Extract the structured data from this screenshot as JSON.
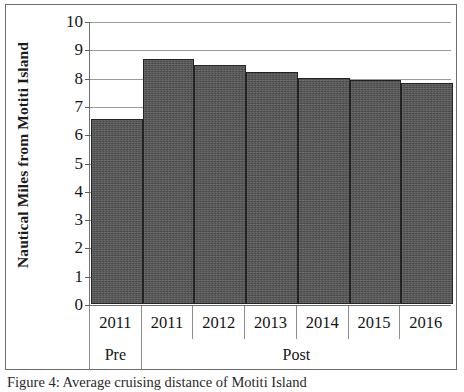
{
  "figure": {
    "caption": "Figure 4: Average cruising distance of Motiti Island"
  },
  "chart_data": {
    "type": "bar",
    "title": "",
    "xlabel": "",
    "ylabel": "Nautical Miles from Motiti Island",
    "categories": [
      "2011",
      "2011",
      "2012",
      "2013",
      "2014",
      "2015",
      "2016"
    ],
    "values": [
      6.55,
      8.65,
      8.45,
      8.2,
      8.0,
      7.9,
      7.8
    ],
    "groups": [
      {
        "label": "Pre",
        "span": 1
      },
      {
        "label": "Post",
        "span": 6
      }
    ],
    "ylim": [
      0,
      10
    ],
    "ytick_labels": [
      "10",
      "9",
      "8",
      "7",
      "6",
      "5",
      "4",
      "3",
      "2",
      "1",
      "0"
    ],
    "ytick_values": [
      10,
      9,
      8,
      7,
      6,
      5,
      4,
      3,
      2,
      1,
      0
    ],
    "grid": true,
    "legend": null,
    "bar_color": "#4b4b4b",
    "gridline_color": "#9a9a9a",
    "axis_color": "#6f6f6f"
  }
}
